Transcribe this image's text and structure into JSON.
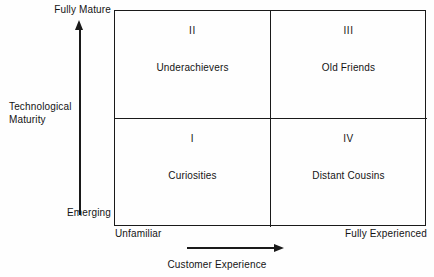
{
  "chart_data": {
    "type": "table",
    "title": "",
    "xlabel": "Customer Experience",
    "ylabel": "Technological Maturity",
    "x_axis": {
      "label": "Customer Experience",
      "min_tick": "Unfamiliar",
      "max_tick": "Fully Experienced"
    },
    "y_axis": {
      "label_line1": "Technological",
      "label_line2": "Maturity",
      "min_tick": "Emerging",
      "max_tick": "Fully Mature"
    },
    "quadrants": [
      {
        "numeral": "II",
        "name": "Underachievers",
        "position": "top-left",
        "x_level": "Unfamiliar",
        "y_level": "Fully Mature"
      },
      {
        "numeral": "III",
        "name": "Old Friends",
        "position": "top-right",
        "x_level": "Fully Experienced",
        "y_level": "Fully Mature"
      },
      {
        "numeral": "I",
        "name": "Curiosities",
        "position": "bottom-left",
        "x_level": "Unfamiliar",
        "y_level": "Emerging"
      },
      {
        "numeral": "IV",
        "name": "Distant Cousins",
        "position": "bottom-right",
        "x_level": "Fully Experienced",
        "y_level": "Emerging"
      }
    ],
    "colors": {
      "line": "#1a1a1a",
      "text": "#141414",
      "background": "#fefefe"
    }
  }
}
